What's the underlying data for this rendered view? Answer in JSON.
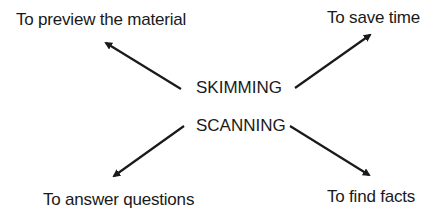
{
  "diagram": {
    "center_terms": [
      "SKIMMING",
      "SCANNING"
    ],
    "purposes": {
      "top_left": "To preview the material",
      "top_right": "To save time",
      "bottom_left": "To answer questions",
      "bottom_right": "To find facts"
    },
    "colors": {
      "text": "#1a1a1a",
      "arrow": "#1a1a1a",
      "background": "#ffffff"
    }
  }
}
